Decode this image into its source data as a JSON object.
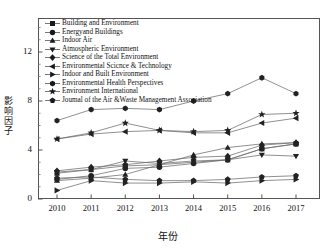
{
  "chart_data": {
    "type": "line",
    "title": "",
    "xlabel": "年份",
    "ylabel": "影响因子",
    "grid": false,
    "legend_position": "upper-left-inside",
    "x": [
      "2010",
      "2011",
      "2012",
      "2013",
      "2014",
      "2015",
      "2016",
      "2017"
    ],
    "categories": [
      "2010",
      "2011",
      "2012",
      "2013",
      "2014",
      "2015",
      "2016",
      "2017"
    ],
    "xlim": [
      2009.4,
      2017.8
    ],
    "ylim": [
      0,
      14.2
    ],
    "yticks": [
      0,
      4,
      8,
      12
    ],
    "ytick_labels": [
      "0",
      "4",
      "8",
      "12"
    ],
    "yminor_step": 1,
    "series": [
      {
        "name": "Building and Environment",
        "marker": "square",
        "values": [
          2.1,
          2.4,
          2.7,
          2.8,
          3.0,
          3.2,
          4.1,
          4.5
        ]
      },
      {
        "name": "Energyand Buildings",
        "marker": "circle",
        "values": [
          1.6,
          1.9,
          2.5,
          2.6,
          2.9,
          3.2,
          4.1,
          4.5
        ]
      },
      {
        "name": "Indoor Air",
        "marker": "triangle-up",
        "values": [
          1.5,
          1.7,
          2.0,
          2.8,
          3.6,
          4.2,
          4.5,
          4.6
        ]
      },
      {
        "name": "Atmospheric Environment",
        "marker": "triangle-down",
        "values": [
          2.2,
          2.4,
          3.1,
          2.9,
          3.1,
          3.2,
          3.6,
          3.5
        ]
      },
      {
        "name": "Science of the Total Environment",
        "marker": "diamond",
        "values": [
          2.3,
          2.6,
          2.8,
          3.1,
          3.4,
          3.5,
          4.4,
          4.6
        ]
      },
      {
        "name": "Environmental Scicnce & Technology",
        "marker": "triangle-left",
        "values": [
          4.9,
          5.3,
          5.5,
          5.6,
          5.4,
          5.4,
          6.2,
          6.6
        ]
      },
      {
        "name": "Indoor and Built Environment",
        "marker": "triangle-right",
        "values": [
          0.7,
          1.5,
          1.3,
          1.3,
          1.4,
          1.3,
          1.5,
          1.6
        ]
      },
      {
        "name": "Environmental Health Perspectives",
        "marker": "hexagon",
        "values": [
          6.4,
          7.3,
          7.4,
          7.3,
          8.0,
          8.6,
          9.9,
          8.6
        ]
      },
      {
        "name": "Environment International",
        "marker": "star",
        "values": [
          4.9,
          5.4,
          6.2,
          5.6,
          5.5,
          5.6,
          6.9,
          7.0
        ]
      },
      {
        "name": "Joumal of the Air &Waste Management Association",
        "marker": "pentagon",
        "values": [
          1.7,
          1.8,
          1.6,
          1.5,
          1.5,
          1.6,
          1.8,
          1.9
        ]
      }
    ]
  },
  "axes": {
    "ylabel_chars": [
      "影",
      "响",
      "因",
      "子"
    ],
    "xlabel": "年份"
  }
}
